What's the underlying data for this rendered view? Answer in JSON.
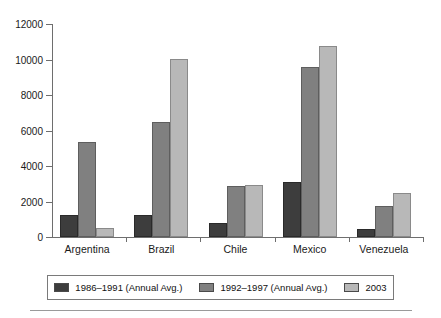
{
  "chart_data": {
    "type": "bar",
    "title": "",
    "xlabel": "",
    "ylabel": "",
    "ylim": [
      0,
      12000
    ],
    "yticks": [
      0,
      2000,
      4000,
      6000,
      8000,
      10000,
      12000
    ],
    "ytick_labels": [
      "0",
      "2000",
      "4000",
      "6000",
      "8000",
      "10000",
      "12000"
    ],
    "grid": false,
    "legend_position": "bottom",
    "categories": [
      "Argentina",
      "Brazil",
      "Chile",
      "Mexico",
      "Venezuela"
    ],
    "series": [
      {
        "name": "1986–1991 (Annual Avg.)",
        "color": "#3d3d3d",
        "values": [
          1250,
          1250,
          800,
          3100,
          450
        ]
      },
      {
        "name": "1992–1997 (Annual Avg.)",
        "color": "#808080",
        "values": [
          5350,
          6500,
          2900,
          9600,
          1750
        ]
      },
      {
        "name": "2003",
        "color": "#b8b8b8",
        "values": [
          500,
          10050,
          2950,
          10750,
          2500
        ]
      }
    ]
  },
  "axis": {
    "color": "#6e6e6e"
  }
}
